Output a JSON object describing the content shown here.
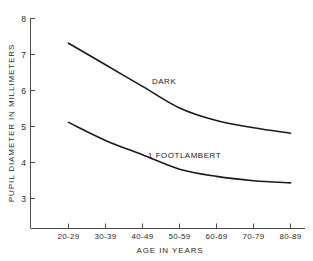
{
  "chart_data": {
    "type": "line",
    "title": "",
    "xlabel": "AGE IN YEARS",
    "ylabel": "PUPIL DIAMETER IN MILLIMETERS",
    "categories": [
      "20-29",
      "30-39",
      "40-49",
      "50-59",
      "60-69",
      "70-79",
      "80-89"
    ],
    "yticks": [
      "3",
      "4",
      "5",
      "6",
      "7",
      "8"
    ],
    "ylim": [
      2.6,
      8
    ],
    "grid": false,
    "legend_position": "inline-annotation",
    "series": [
      {
        "name": "DARK",
        "label": "DARK",
        "values": [
          7.3,
          6.7,
          6.1,
          5.5,
          5.15,
          4.95,
          4.8
        ]
      },
      {
        "name": "1 FOOTLAMBERT",
        "label": "1 FOOTLAMBERT",
        "values": [
          5.1,
          4.6,
          4.2,
          3.8,
          3.6,
          3.48,
          3.42
        ]
      }
    ],
    "annotations": [
      {
        "text": "DARK",
        "x_category": "40-49",
        "y_value": 6.2
      },
      {
        "text": "1 FOOTLAMBERT",
        "x_category": "40-49",
        "y_value": 4.35
      }
    ],
    "colors": {
      "background": "#ffffff",
      "axis": "#4d4d4d",
      "curve": "#1a1a1a",
      "text": "#2b2b2b"
    }
  }
}
